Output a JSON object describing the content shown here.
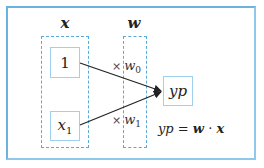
{
  "diagram": {
    "input_group_label": "x",
    "weight_group_label": "w",
    "inputs": [
      {
        "label": "1",
        "subscript": ""
      },
      {
        "label": "x",
        "subscript": "1"
      }
    ],
    "weights": [
      {
        "operator": "×",
        "label": "w",
        "subscript": "0"
      },
      {
        "operator": "×",
        "label": "w",
        "subscript": "1"
      }
    ],
    "output": {
      "label": "yp"
    },
    "equation": {
      "lhs": "yp",
      "equals": "=",
      "term1": "w",
      "dot": "·",
      "term2": "x"
    },
    "colors": {
      "frame": "#6cb4e0",
      "dashed_group": "#5aaad8",
      "node_border": "#9fd0ee",
      "arrow": "#222222"
    }
  }
}
